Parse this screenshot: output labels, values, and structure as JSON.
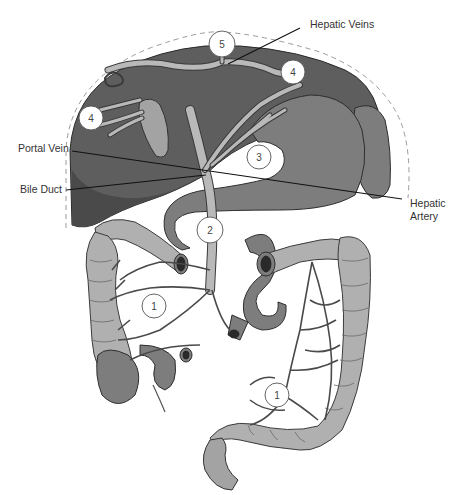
{
  "figure": {
    "labels": {
      "hepatic_veins": "Hepatic Veins",
      "portal_vein": "Portal Vein",
      "bile_duct": "Bile Duct",
      "hepatic_artery_line1": "Hepatic",
      "hepatic_artery_line2": "Artery"
    },
    "callouts": [
      {
        "id": "5",
        "label": "5",
        "x": 222,
        "y": 44
      },
      {
        "id": "4a",
        "label": "4",
        "x": 293,
        "y": 72
      },
      {
        "id": "4b",
        "label": "4",
        "x": 91,
        "y": 118
      },
      {
        "id": "3",
        "label": "3",
        "x": 259,
        "y": 157
      },
      {
        "id": "2",
        "label": "2",
        "x": 210,
        "y": 230
      },
      {
        "id": "1a",
        "label": "1",
        "x": 154,
        "y": 306
      },
      {
        "id": "1b",
        "label": "1",
        "x": 277,
        "y": 395
      }
    ],
    "colors": {
      "liver": "#5e5e5e",
      "vessel": "#b9b9b9",
      "colon": "#b0b0b0",
      "leader_line": "#111111",
      "text": "#333333"
    }
  }
}
